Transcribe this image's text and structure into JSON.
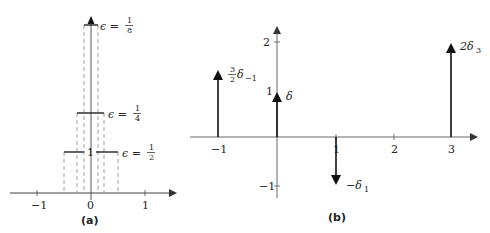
{
  "panel_a": {
    "caption": "(a)",
    "x_ticks": [
      "−1",
      "0",
      "1"
    ],
    "height_label": "1",
    "boxes": [
      {
        "label_lhs": "ϵ =",
        "num": "1",
        "den": "2"
      },
      {
        "label_lhs": "ϵ =",
        "num": "1",
        "den": "4"
      },
      {
        "label_lhs": "ϵ =",
        "num": "1",
        "den": "8"
      }
    ]
  },
  "panel_b": {
    "caption": "(b)",
    "x_ticks": [
      "−1",
      "1",
      "2",
      "3"
    ],
    "y_ticks": [
      "2",
      "1",
      "−1"
    ],
    "impulses": [
      {
        "at": "−1",
        "weight": "3/2",
        "label_frac_num": "3",
        "label_frac_den": "2",
        "label_rest": "δ",
        "label_sub": "−1"
      },
      {
        "at": "0",
        "weight": "1",
        "label": "δ"
      },
      {
        "at": "1",
        "weight": "−1",
        "label": "−δ",
        "label_sub": "1"
      },
      {
        "at": "3",
        "weight": "2",
        "label": "2δ",
        "label_sub": "3"
      }
    ]
  },
  "colors": {
    "ink": "#222222",
    "dash": "#777777",
    "axis": "#444444"
  }
}
